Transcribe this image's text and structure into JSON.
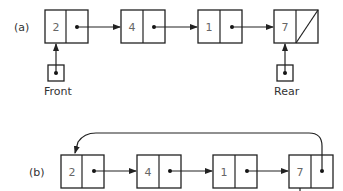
{
  "diagram": {
    "type": "linked-list-queue",
    "part_a": {
      "label": "(a)",
      "nodes": [
        {
          "value": "2",
          "next": "pointer"
        },
        {
          "value": "4",
          "next": "pointer"
        },
        {
          "value": "1",
          "next": "pointer"
        },
        {
          "value": "7",
          "next": "null"
        }
      ],
      "front_label": "Front",
      "rear_label": "Rear"
    },
    "part_b": {
      "label": "(b)",
      "nodes": [
        {
          "value": "2",
          "next": "pointer"
        },
        {
          "value": "4",
          "next": "pointer"
        },
        {
          "value": "1",
          "next": "pointer"
        },
        {
          "value": "7",
          "next": "circular-to-first"
        }
      ]
    },
    "colors": {
      "line": "#222222",
      "text": "#666666",
      "background": "#ffffff"
    }
  }
}
